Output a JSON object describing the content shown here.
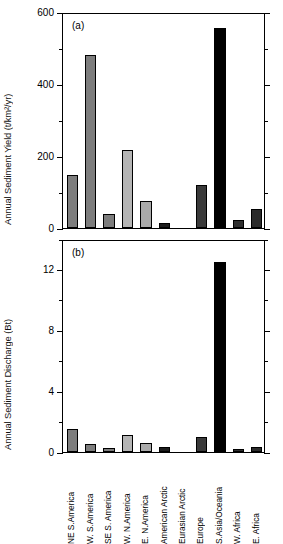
{
  "figure": {
    "categories": [
      "NE S.America",
      "W. S.America",
      "SE S. America",
      "W. N.America",
      "E. N.America",
      "American Arctic",
      "Eurasian Arctic",
      "Europe",
      "S.Asia/Oceania",
      "W. Africa",
      "E. Africa"
    ],
    "bar_colors": [
      "#7d7d7d",
      "#7d7d7d",
      "#7d7d7d",
      "#b5b5b5",
      "#aaaaaa",
      "#1c1c1c",
      "#3b3b3b",
      "#3a3a3a",
      "#000000",
      "#2f2f2f",
      "#2b2b2b"
    ]
  },
  "chart_data": [
    {
      "type": "bar",
      "panel": "(a)",
      "title": "",
      "xlabel": "",
      "ylabel": "Annual Sediment Yield (t/km²/yr)",
      "categories": [
        "NE S.America",
        "W. S.America",
        "SE S. America",
        "W. N.America",
        "E. N.America",
        "American Arctic",
        "Eurasian Arctic",
        "Europe",
        "S.Asia/Oceania",
        "W. Africa",
        "E. Africa"
      ],
      "values": [
        146,
        480,
        40,
        218,
        75,
        15,
        0,
        120,
        555,
        23,
        52
      ],
      "ylim": [
        0,
        600
      ],
      "yticks": [
        0,
        200,
        400,
        600
      ],
      "yticklabels": [
        "0",
        "200",
        "400",
        "600"
      ],
      "minor_yticks": [
        100,
        300,
        500
      ],
      "grid": false,
      "legend": "none"
    },
    {
      "type": "bar",
      "panel": "(b)",
      "title": "",
      "xlabel": "",
      "ylabel": "Annual Sediment Discharge (Bt)",
      "categories": [
        "NE S.America",
        "W. S.America",
        "SE S. America",
        "W. N.America",
        "E. N.America",
        "American Arctic",
        "Eurasian Arctic",
        "Europe",
        "S.Asia/Oceania",
        "W. Africa",
        "E. Africa"
      ],
      "values": [
        1.5,
        0.5,
        0.25,
        1.1,
        0.6,
        0.3,
        0.0,
        1.0,
        12.5,
        0.2,
        0.35
      ],
      "ylim": [
        0,
        14
      ],
      "yticks": [
        0,
        4,
        8,
        12
      ],
      "yticklabels": [
        "0",
        "4",
        "8",
        "12"
      ],
      "minor_yticks": [
        2,
        6,
        10,
        14
      ],
      "grid": false,
      "legend": "none"
    }
  ]
}
